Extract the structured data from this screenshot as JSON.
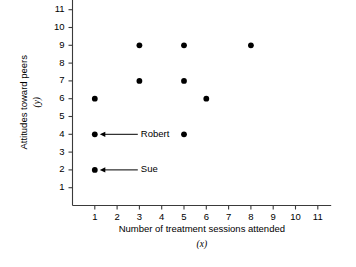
{
  "chart_data": {
    "type": "scatter",
    "title": "",
    "xlabel": "Number of treatment sessions attended",
    "xlabel_var": "(x)",
    "ylabel": "Attitudes toward peers",
    "ylabel_var": "(y)",
    "xlim": [
      0,
      11.6
    ],
    "ylim": [
      0,
      11.6
    ],
    "xticks": [
      1,
      2,
      3,
      4,
      5,
      6,
      7,
      8,
      9,
      10,
      11
    ],
    "yticks": [
      1,
      2,
      3,
      4,
      5,
      6,
      7,
      8,
      9,
      10,
      11
    ],
    "xtick_labels": [
      "1",
      "2",
      "3",
      "4",
      "5",
      "6",
      "7",
      "8",
      "9",
      "10",
      "11"
    ],
    "ytick_labels": [
      "1",
      "2",
      "3",
      "4",
      "5",
      "6",
      "7",
      "8",
      "9",
      "10",
      "11"
    ],
    "grid": false,
    "legend": "none",
    "marker_color": "#000000",
    "axis_color": "#3a3a3a",
    "background_color": "#ffffff",
    "points": [
      {
        "x": 1,
        "y": 6
      },
      {
        "x": 1,
        "y": 4
      },
      {
        "x": 1,
        "y": 2
      },
      {
        "x": 3,
        "y": 9
      },
      {
        "x": 3,
        "y": 7
      },
      {
        "x": 5,
        "y": 9
      },
      {
        "x": 5,
        "y": 7
      },
      {
        "x": 5,
        "y": 4
      },
      {
        "x": 6,
        "y": 6
      },
      {
        "x": 8,
        "y": 9
      }
    ],
    "annotations": [
      {
        "label": "Robert",
        "x": 1,
        "y": 4
      },
      {
        "label": "Sue",
        "x": 1,
        "y": 2
      }
    ]
  }
}
